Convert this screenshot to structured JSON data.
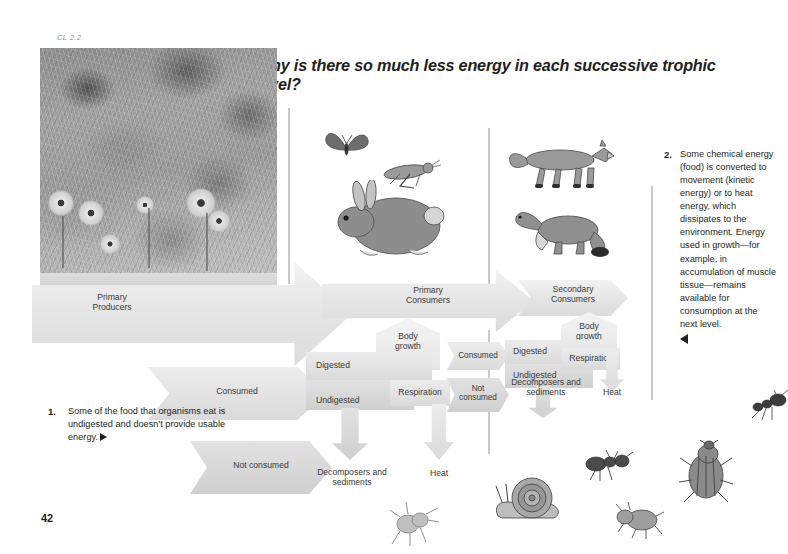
{
  "page": {
    "chapter_tag": "CL 2.2",
    "page_number": "42",
    "title": "Why is there so much less energy in each successive trophic level?"
  },
  "photo": {
    "alt_name": "meadow-wildflowers-photograph"
  },
  "diagram": {
    "trophic_levels": [
      {
        "id": "primary-producers",
        "label": "Primary\nProducers",
        "line1": "Primary",
        "line2": "Producers"
      },
      {
        "id": "primary-consumers",
        "label": "Primary\nConsumers",
        "line1": "Primary",
        "line2": "Consumers"
      },
      {
        "id": "secondary-consumers",
        "label": "Secondary\nConsumers",
        "line1": "Secondary",
        "line2": "Consumers"
      }
    ],
    "producer_outputs": {
      "consumed": "Consumed",
      "not_consumed": "Not consumed"
    },
    "primary_consumer_outputs": {
      "body_growth_line1": "Body",
      "body_growth_line2": "growth",
      "digested": "Digested",
      "undigested": "Undigested",
      "respiration": "Respiration",
      "decomposers_line1": "Decomposers and",
      "decomposers_line2": "sediments",
      "heat": "Heat",
      "consumed": "Consumed",
      "not_consumed_line1": "Not",
      "not_consumed_line2": "consumed"
    },
    "secondary_consumer_outputs": {
      "body_growth_line1": "Body",
      "body_growth_line2": "growth",
      "digested": "Digested",
      "undigested": "Undigested",
      "respiration": "Respiration",
      "decomposers_line1": "Decomposers and",
      "decomposers_line2": "sediments",
      "heat": "Heat"
    }
  },
  "notes": [
    {
      "number": "1.",
      "text": "Some of the food that organisms eat is undigested and doesn't provide usable energy.",
      "pointer": "triangle-right"
    },
    {
      "number": "2.",
      "text": "Some chemical energy (food) is converted to movement (kinetic energy) or to heat energy, which dissipates to the environment. Energy used in growth—for example, in accumulation of muscle tissue—remains available for consumption at the next level.",
      "pointer": "triangle-left"
    }
  ],
  "organisms": [
    {
      "name": "butterfly",
      "group": "primary-consumers"
    },
    {
      "name": "grasshopper",
      "group": "primary-consumers"
    },
    {
      "name": "rabbit",
      "group": "primary-consumers"
    },
    {
      "name": "fox",
      "group": "secondary-consumers"
    },
    {
      "name": "weasel",
      "group": "secondary-consumers"
    },
    {
      "name": "beetle-small",
      "group": "decomposers"
    },
    {
      "name": "snail",
      "group": "decomposers"
    },
    {
      "name": "ant",
      "group": "decomposers"
    },
    {
      "name": "beetle-large",
      "group": "decomposers"
    },
    {
      "name": "fly",
      "group": "decomposers"
    },
    {
      "name": "ant-edge",
      "group": "decomposers"
    }
  ],
  "colors": {
    "ink": "#231f20",
    "label_ink": "#3a3a3a",
    "shape_light": "#f2f2f2",
    "shape_mid": "#e4e4e4",
    "shape_dark": "#cfcfcf",
    "rule": "#c9c9c9",
    "tag_gray": "#8c8c8c"
  }
}
